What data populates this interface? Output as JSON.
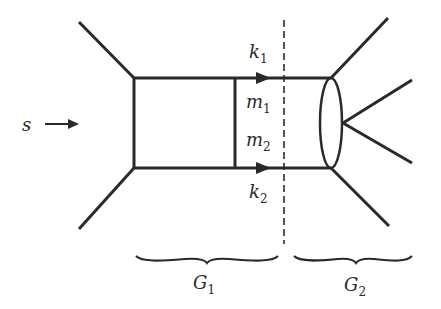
{
  "diagram": {
    "type": "feynman-diagram",
    "colors": {
      "line": "#2a2a2a",
      "background": "#ffffff"
    },
    "labels": {
      "s": "s",
      "k1": {
        "base": "k",
        "sub": "1"
      },
      "k2": {
        "base": "k",
        "sub": "2"
      },
      "m1": {
        "base": "m",
        "sub": "1"
      },
      "m2": {
        "base": "m",
        "sub": "2"
      },
      "G1": {
        "base": "G",
        "sub": "1"
      },
      "G2": {
        "base": "G",
        "sub": "2"
      }
    },
    "regions": [
      {
        "name": "G1",
        "description": "box subgraph (left of cut)"
      },
      {
        "name": "G2",
        "description": "blob subgraph (right of cut)"
      }
    ],
    "cut": {
      "style": "dashed",
      "orientation": "vertical"
    }
  }
}
